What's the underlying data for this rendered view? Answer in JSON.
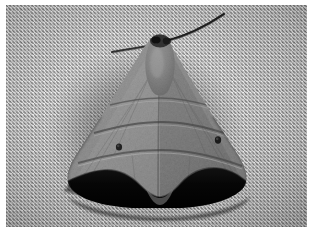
{
  "image": {
    "kind": "photograph",
    "subject": "moth",
    "color_mode": "grayscale",
    "width": 314,
    "height": 234,
    "alt_text": "Black-and-white photograph of a triangular moth resting on a woven wire mesh screen",
    "border_color": "#ffffff",
    "border_width_px": 6
  },
  "background": {
    "name": "woven wire mesh screen",
    "description": "Fine diagonal crosshatch weave, light gray with darker interstices",
    "base_color": "#a3a3a3",
    "highlight_color": "#e8e8e8",
    "shadow_color": "#4a4a4a",
    "weave_angle_deg": 45,
    "weave_period_px": 3.7
  },
  "subject": {
    "name": "moth",
    "pose": "wings folded in a broad triangle, head up",
    "body_color": "#8c8880",
    "wing_light_color": "#a9a49a",
    "wing_mid_color": "#8b8680",
    "wing_dark_color": "#5f5b56",
    "hindwing_band_color": "#0c0b0a",
    "shadow_color": "#3a3835",
    "parts": {
      "head_label": "head and thorax",
      "right_antenna_label": "right antenna",
      "left_antenna_label": "left antenna",
      "left_forewing_label": "left forewing",
      "right_forewing_label": "right forewing",
      "dark_hindwing_band_label": "dark hindwing band",
      "discal_spot_left_label": "left discal spot",
      "discal_spot_right_label": "right discal spot",
      "transverse_line_label": "transverse wing line"
    },
    "markings": {
      "transverse_lines_count": 3,
      "discal_spots_count": 2
    }
  }
}
